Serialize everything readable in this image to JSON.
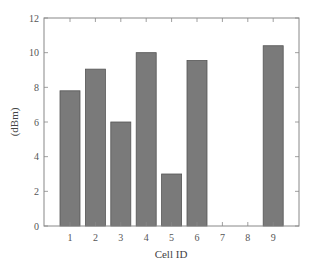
{
  "chart_data": {
    "type": "bar",
    "title": "",
    "xlabel": "Cell ID",
    "ylabel": "(dBm)",
    "categories": [
      "1",
      "2",
      "3",
      "4",
      "5",
      "6",
      "7",
      "8",
      "9"
    ],
    "values": [
      7.8,
      9.05,
      6.0,
      10.0,
      3.0,
      9.55,
      0,
      0,
      10.4
    ],
    "ylim": [
      0,
      12
    ],
    "yticks": [
      0,
      2,
      4,
      6,
      8,
      10,
      12
    ],
    "grid": false,
    "legend": null,
    "bar_color": "#7a7a7a"
  }
}
